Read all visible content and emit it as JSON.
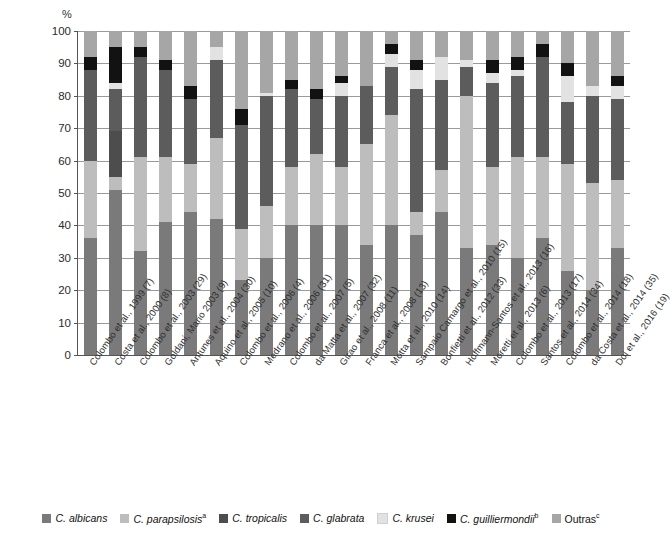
{
  "chart_data": {
    "type": "bar",
    "stacked": true,
    "title": "",
    "subtitle": "",
    "xlabel": "",
    "ylabel": "%",
    "ylim": [
      0,
      100
    ],
    "yticks": [
      0,
      10,
      20,
      30,
      40,
      50,
      60,
      70,
      80,
      90,
      100
    ],
    "grid": true,
    "legend_position": "bottom",
    "categories": [
      "Colombo et al., 1999 (7)",
      "Costa et al., 2000 (8)",
      "Colombo et al., 2003 (29)",
      "Goldani, Mario 2003 (9)",
      "Antunes et al., 2004 (30)",
      "Aquino et al., 2005 (10)",
      "Colombo et al., 2006 (4)",
      "Medrano et al., 2006 (31)",
      "Colombo et al., 2007 (5)",
      "da Matta et al., 2007 (32)",
      "Girao et al., 2008 (11)",
      "Franca et al., 2008 (13)",
      "Motta et al., 2010 (14)",
      "Sampaio Camargo et al., 2010 (15)",
      "Bonfietti et al., 2012 (33)",
      "Hoffmann-Santos et al., 2013 (16)",
      "Moretti et al., 2013 (6)",
      "Colombo et al., 2013 (17)",
      "Santos et al., 2014 (34)",
      "Colombo et al., 2014 (18)",
      "da Costa et al., 2014 (35)",
      "Doi et al., 2016 (19)"
    ],
    "series": [
      {
        "name": "C. albicans",
        "color": "#7a7a7a",
        "values": [
          36,
          51,
          32,
          41,
          44,
          42,
          23,
          30,
          40,
          40,
          40,
          34,
          40,
          37,
          44,
          33,
          34,
          30,
          36,
          26,
          20,
          33
        ]
      },
      {
        "name": "C. parapsilosis",
        "superscript": "a",
        "color": "#bdbdbd",
        "values": [
          24,
          4,
          29,
          20,
          15,
          25,
          16,
          16,
          18,
          22,
          18,
          31,
          34,
          7,
          13,
          47,
          24,
          31,
          25,
          33,
          33,
          21
        ]
      },
      {
        "name": "C. tropicalis",
        "color": "#4d4d4d",
        "values": [
          0,
          14,
          0,
          0,
          0,
          0,
          0,
          0,
          0,
          0,
          0,
          0,
          0,
          0,
          0,
          0,
          0,
          0,
          0,
          0,
          0,
          0
        ]
      },
      {
        "name": "C. glabrata",
        "color": "#5c5c5c",
        "values": [
          28,
          13,
          31,
          27,
          20,
          24,
          32,
          34,
          24,
          17,
          22,
          18,
          15,
          38,
          28,
          9,
          26,
          25,
          31,
          19,
          27,
          25
        ]
      },
      {
        "name": "C. krusei",
        "color": "#e2e2e2",
        "values": [
          0,
          2,
          0,
          0,
          0,
          4,
          0,
          1,
          0,
          0,
          4,
          0,
          4,
          6,
          7,
          2,
          3,
          2,
          0,
          8,
          3,
          4
        ]
      },
      {
        "name": "C. guilliermondii",
        "superscript": "b",
        "color": "#121212",
        "values": [
          4,
          11,
          3,
          3,
          4,
          0,
          5,
          0,
          3,
          3,
          2,
          0,
          3,
          3,
          0,
          0,
          4,
          4,
          4,
          4,
          0,
          3
        ]
      },
      {
        "name": "Outras",
        "superscript": "c",
        "color": "#a6a6a6",
        "values": [
          8,
          5,
          5,
          9,
          17,
          5,
          24,
          19,
          15,
          18,
          14,
          17,
          4,
          9,
          8,
          9,
          9,
          8,
          4,
          10,
          17,
          14
        ]
      }
    ]
  },
  "legend": {
    "items": [
      {
        "label": "C. albicans",
        "sup": "",
        "color": "#7a7a7a",
        "italic": true
      },
      {
        "label": "C. parapsilosis",
        "sup": "a",
        "color": "#bdbdbd",
        "italic": true
      },
      {
        "label": "C. tropicalis",
        "sup": "",
        "color": "#4d4d4d",
        "italic": true
      },
      {
        "label": "C. glabrata",
        "sup": "",
        "color": "#5c5c5c",
        "italic": true
      },
      {
        "label": "C. krusei",
        "sup": "",
        "color": "#e2e2e2",
        "italic": true
      },
      {
        "label": "C. guilliermondii",
        "sup": "b",
        "color": "#121212",
        "italic": true
      },
      {
        "label": "Outras",
        "sup": "c",
        "color": "#a6a6a6",
        "italic": false
      }
    ]
  },
  "axis": {
    "y_title": "%"
  }
}
